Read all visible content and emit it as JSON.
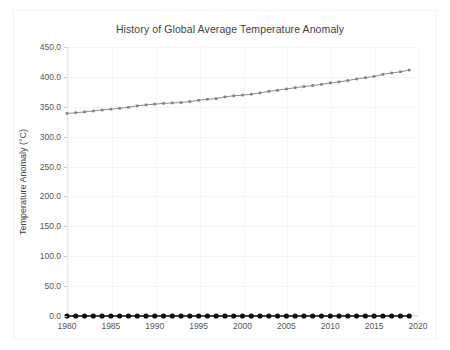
{
  "figure": {
    "title": "History of Global Average Temperature Anomaly",
    "background_color": "#ffffff",
    "border_color": "#f2f2f2"
  },
  "axes": {
    "y_label": "Temperature Anomaly (°C)",
    "y_ticks": [
      "450.0",
      "400.0",
      "350.0",
      "300.0",
      "250.0",
      "200.0",
      "150.0",
      "100.0",
      "50.0",
      "0.0"
    ],
    "x_ticks": [
      "1980",
      "1985",
      "1990",
      "1995",
      "2000",
      "2005",
      "2010",
      "2015",
      "2020"
    ]
  },
  "chart_data": {
    "type": "line",
    "title": "History of Global Average Temperature Anomaly",
    "xlabel": "",
    "ylabel": "Temperature Anomaly (°C)",
    "xlim": [
      1980,
      2020
    ],
    "ylim": [
      0.0,
      450.0
    ],
    "y_tick_values": [
      0.0,
      50.0,
      100.0,
      150.0,
      200.0,
      250.0,
      300.0,
      350.0,
      400.0,
      450.0
    ],
    "x_tick_values": [
      1980,
      1985,
      1990,
      1995,
      2000,
      2005,
      2010,
      2015,
      2020
    ],
    "grid": true,
    "legend": "none",
    "x": [
      1980,
      1981,
      1982,
      1983,
      1984,
      1985,
      1986,
      1987,
      1988,
      1989,
      1990,
      1991,
      1992,
      1993,
      1994,
      1995,
      1996,
      1997,
      1998,
      1999,
      2000,
      2001,
      2002,
      2003,
      2004,
      2005,
      2006,
      2007,
      2008,
      2009,
      2010,
      2011,
      2012,
      2013,
      2014,
      2015,
      2016,
      2017,
      2018,
      2019
    ],
    "series": [
      {
        "name": "concentration",
        "color": "#808080",
        "marker": "square",
        "marker_color": "#808080",
        "line_style": "solid",
        "values": [
          338.8,
          340.1,
          341.4,
          343.0,
          344.6,
          346.0,
          347.4,
          349.2,
          351.6,
          353.1,
          354.4,
          355.6,
          356.4,
          357.1,
          358.8,
          360.8,
          362.6,
          363.7,
          366.6,
          368.3,
          369.5,
          371.0,
          373.2,
          375.8,
          377.5,
          379.8,
          381.9,
          383.8,
          385.6,
          387.4,
          389.9,
          391.6,
          393.9,
          396.5,
          398.6,
          400.8,
          404.2,
          406.5,
          408.5,
          411.4
        ]
      },
      {
        "name": "anomaly",
        "color": "#111111",
        "marker": "circle",
        "marker_color": "#111111",
        "line_style": "solid",
        "values": [
          0.0,
          0.0,
          0.0,
          0.0,
          0.0,
          0.0,
          0.0,
          0.0,
          0.0,
          0.0,
          0.0,
          0.0,
          0.0,
          0.0,
          0.0,
          0.0,
          0.0,
          0.0,
          0.0,
          0.0,
          0.0,
          0.0,
          0.0,
          0.0,
          0.0,
          0.0,
          0.0,
          0.0,
          0.0,
          0.0,
          0.0,
          0.0,
          0.0,
          0.0,
          0.0,
          0.0,
          0.0,
          0.0,
          0.0,
          0.0
        ]
      }
    ]
  }
}
